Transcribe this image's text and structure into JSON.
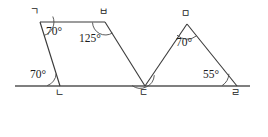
{
  "figure": {
    "baseline": {
      "name": "straight-line",
      "x1": 15,
      "y1": 86,
      "x2": 250,
      "y2": 86
    },
    "colors": {
      "stroke": "#3a3a3a",
      "baseline_stroke": "#555555",
      "text": "#1c1c1c",
      "background": "#ffffff"
    },
    "vertices": [
      {
        "id": "g",
        "label": "ㄱ",
        "x": 40,
        "y": 22,
        "label_x": 30,
        "label_y": 7
      },
      {
        "id": "b",
        "label": "ㅂ",
        "x": 105,
        "y": 22,
        "label_x": 99,
        "label_y": 7
      },
      {
        "id": "m",
        "label": "ㅁ",
        "x": 187,
        "y": 24,
        "label_x": 181,
        "label_y": 9
      },
      {
        "id": "n",
        "label": "ㄴ",
        "x": 60,
        "y": 86,
        "label_x": 55,
        "label_y": 88
      },
      {
        "id": "d",
        "label": "ㄷ",
        "x": 145,
        "y": 86,
        "label_x": 139,
        "label_y": 88
      },
      {
        "id": "r",
        "label": "ㄹ",
        "x": 237,
        "y": 86,
        "label_x": 231,
        "label_y": 88
      }
    ],
    "segments": [
      {
        "name": "segment-g-n",
        "x1": 40,
        "y1": 22,
        "x2": 60,
        "y2": 86
      },
      {
        "name": "segment-g-b",
        "x1": 40,
        "y1": 22,
        "x2": 105,
        "y2": 22
      },
      {
        "name": "segment-b-d",
        "x1": 105,
        "y1": 22,
        "x2": 145,
        "y2": 86
      },
      {
        "name": "segment-d-m",
        "x1": 145,
        "y1": 86,
        "x2": 187,
        "y2": 24
      },
      {
        "name": "segment-m-r",
        "x1": 187,
        "y1": 24,
        "x2": 237,
        "y2": 86
      }
    ],
    "angles": [
      {
        "name": "angle-at-g",
        "value": "70°",
        "x": 46,
        "y": 26,
        "vertex": "ㄱ"
      },
      {
        "name": "angle-at-b",
        "value": "125°",
        "x": 80,
        "y": 33,
        "vertex": "ㅂ"
      },
      {
        "name": "angle-at-n",
        "value": "70°",
        "x": 30,
        "y": 70,
        "vertex": "ㄴ"
      },
      {
        "name": "angle-at-m",
        "value": "70°",
        "x": 177,
        "y": 37,
        "vertex": "ㅁ"
      },
      {
        "name": "angle-at-r",
        "value": "55°",
        "x": 203,
        "y": 70,
        "vertex": "ㄹ"
      }
    ],
    "angle_arcs": [
      {
        "name": "arc-g",
        "cx": 40,
        "cy": 22,
        "r": 14
      },
      {
        "name": "arc-b",
        "cx": 105,
        "cy": 22,
        "r": 13
      },
      {
        "name": "arc-n",
        "cx": 60,
        "cy": 86,
        "r": 13
      },
      {
        "name": "arc-m",
        "cx": 187,
        "cy": 24,
        "r": 15
      },
      {
        "name": "arc-d",
        "cx": 145,
        "cy": 86,
        "r": 14
      },
      {
        "name": "arc-r",
        "cx": 237,
        "cy": 86,
        "r": 15
      }
    ]
  },
  "answer": {
    "open_paren": "(",
    "close_paren": ")",
    "unit": "도",
    "value": ""
  }
}
